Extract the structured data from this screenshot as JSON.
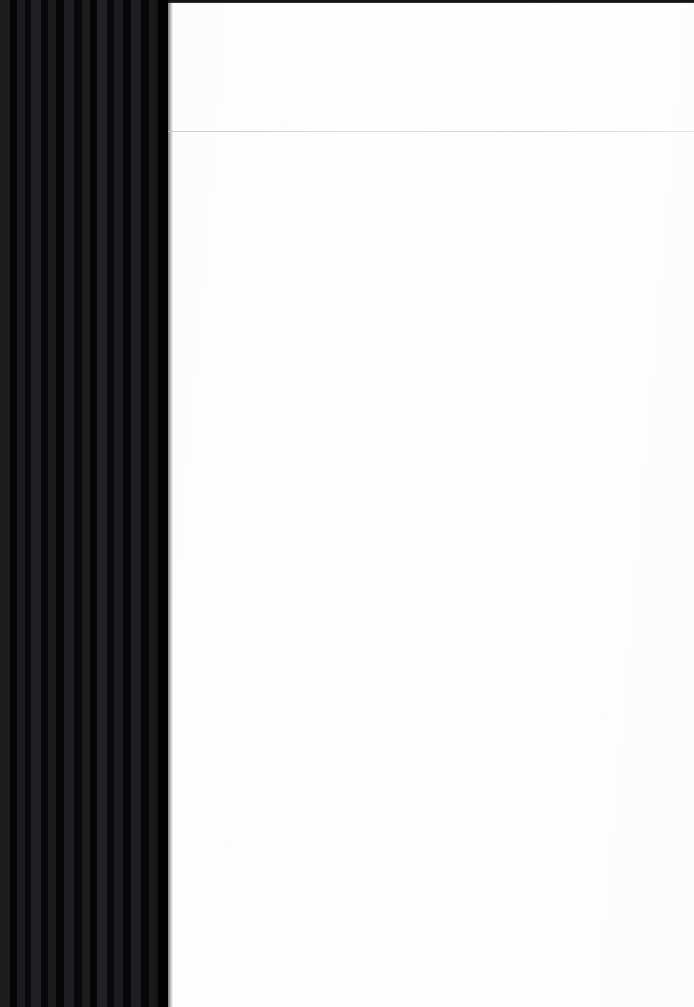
{
  "document": {
    "kind": "scanned-page",
    "orientation": "portrait",
    "page_width_px": 694,
    "page_height_px": 1007,
    "paper_color": "#fefeff",
    "content_text": "",
    "notes_text": ""
  },
  "gutter": {
    "label": "spine-gutter-shadow",
    "width_px": 168,
    "base_color": "#141416",
    "dark_stripe_color": "#050506",
    "light_stripe_color": "#212125",
    "stripe_count": 20
  },
  "top_edge": {
    "label": "scan-top-border",
    "height_px": 3,
    "color": "#111114"
  },
  "header_rule": {
    "label": "horizontal-rule",
    "y_px": 131,
    "color": "#c6c6ca",
    "thickness_px": 1
  },
  "regions": {
    "header_area_label": "page-header-blank",
    "body_area_label": "page-body-blank"
  }
}
